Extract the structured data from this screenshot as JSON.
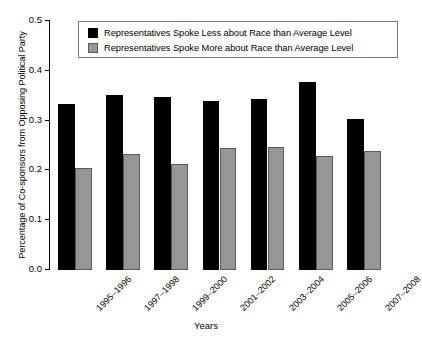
{
  "chart_data": {
    "type": "bar",
    "title": "",
    "xlabel": "Years",
    "ylabel": "Percentage of Co-sponsors from Opposing Political Party",
    "categories": [
      "1995–1996",
      "1997–1998",
      "1999–2000",
      "2001–2002",
      "2003–2004",
      "2005–2006",
      "2007–2008"
    ],
    "series": [
      {
        "name": "Representatives Spoke Less about Race than Average Level",
        "color": "#000000",
        "values": [
          0.333,
          0.352,
          0.347,
          0.339,
          0.343,
          0.377,
          0.303
        ]
      },
      {
        "name": "Representatives Spoke More about Race than Average Level",
        "color": "#969696",
        "values": [
          0.205,
          0.233,
          0.213,
          0.245,
          0.248,
          0.229,
          0.239
        ]
      }
    ],
    "ylim": [
      0.0,
      0.5
    ],
    "ytick_labels": [
      "0.0",
      "0.1",
      "0.2",
      "0.3",
      "0.4",
      "0.5"
    ],
    "ytick_values": [
      0.0,
      0.1,
      0.2,
      0.3,
      0.4,
      0.5
    ],
    "grid": false,
    "legend_position": "top-center",
    "xtick_rotation": -45
  },
  "legend": {
    "entries": [
      {
        "label": "Representatives Spoke Less about Race than Average Level",
        "swatch": "black-square-icon"
      },
      {
        "label": "Representatives Spoke More about Race than Average Level",
        "swatch": "grey-square-icon"
      }
    ]
  }
}
